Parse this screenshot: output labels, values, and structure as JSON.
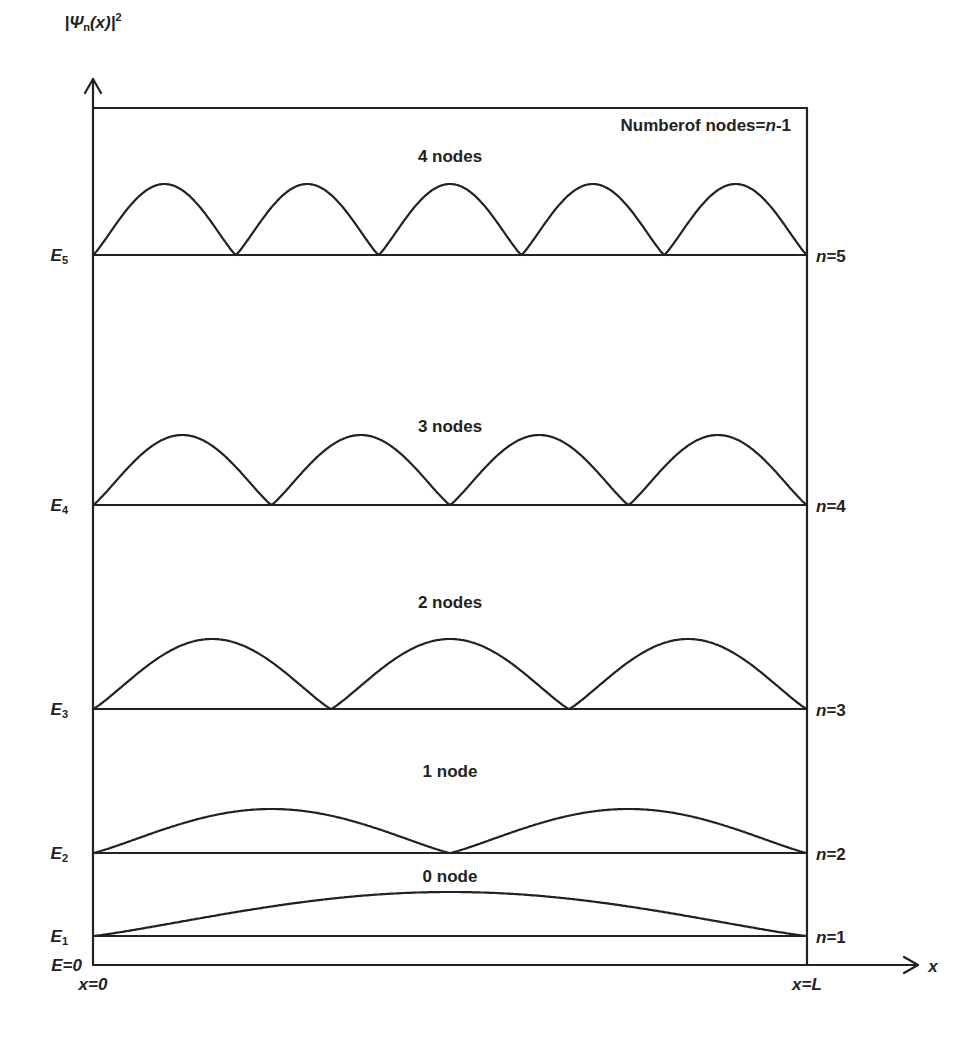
{
  "chart_data": {
    "type": "line",
    "ylabel": "|Ψn(x)|²",
    "xlabel": "x",
    "x_left_label": "x=0",
    "x_right_label": "x=L",
    "baseline_label": "E=0",
    "annotation": "Numberof nodes=n-1",
    "series": [
      {
        "n": 1,
        "energy_label": "E1",
        "n_label": "n=1",
        "nodes": 0,
        "node_label": "0 node",
        "lobes": 1
      },
      {
        "n": 2,
        "energy_label": "E2",
        "n_label": "n=2",
        "nodes": 1,
        "node_label": "1 node",
        "lobes": 2
      },
      {
        "n": 3,
        "energy_label": "E3",
        "n_label": "n=3",
        "nodes": 2,
        "node_label": "2 nodes",
        "lobes": 3
      },
      {
        "n": 4,
        "energy_label": "E4",
        "n_label": "n=4",
        "nodes": 3,
        "node_label": "3 nodes",
        "lobes": 4
      },
      {
        "n": 5,
        "energy_label": "E5",
        "n_label": "n=5",
        "nodes": 4,
        "node_label": "4 nodes",
        "lobes": 5
      }
    ],
    "grid": false,
    "legend": "none"
  },
  "layout": {
    "box": {
      "x0": 93,
      "x1": 807,
      "top": 108,
      "bottom": 965
    },
    "levels": [
      {
        "n": 1,
        "y": 936,
        "peak_y": 892,
        "label_y": 882
      },
      {
        "n": 2,
        "y": 853,
        "peak_y": 809,
        "label_y": 777
      },
      {
        "n": 3,
        "y": 709,
        "peak_y": 639,
        "label_y": 608
      },
      {
        "n": 4,
        "y": 505,
        "peak_y": 435,
        "label_y": 432
      },
      {
        "n": 5,
        "y": 255,
        "peak_y": 184,
        "label_y": 162
      }
    ],
    "y_axis_arrow_tip": 79,
    "x_axis_arrow_tip": 918
  },
  "labels": {
    "y_axis": {
      "main": "|Ψ",
      "sub": "n",
      "rest": "(x)|",
      "sup": "2"
    },
    "annotation": {
      "pre": "Numberof nodes=",
      "n": "n",
      "post": "-1"
    },
    "x_axis": "x",
    "x0": "x=0",
    "xL": "x=L",
    "e0": "E=0"
  },
  "colors": {
    "ink": "#222222",
    "background": "#ffffff"
  }
}
